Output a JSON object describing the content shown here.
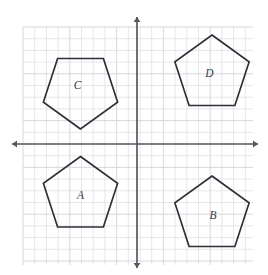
{
  "figure": {
    "kind": "coordinate-plane-with-pentagons",
    "width": 268,
    "height": 275,
    "background_color": "#ffffff"
  },
  "grid": {
    "visible": true,
    "minor_color": "#dcdce2",
    "major_color": "#d2d2da",
    "cell_size_px": 11.7,
    "major_every": 4,
    "x_start": 23,
    "x_end": 253,
    "y_start": 27,
    "y_end": 265
  },
  "axes": {
    "color": "#575760",
    "origin_x": 137,
    "origin_y": 144,
    "x_axis": {
      "label": "",
      "start_x": 12,
      "end_x": 258,
      "arrows": "both"
    },
    "y_axis": {
      "label": "",
      "start_y": 17,
      "end_y": 268,
      "arrows": "both"
    },
    "tick_labels": []
  },
  "chart_data": {
    "type": "scatter",
    "title": "",
    "xlabel": "",
    "ylabel": "",
    "grid": true,
    "legend": "none",
    "shapes": [
      {
        "label": "A",
        "kind": "regular-pentagon",
        "quadrant": "III",
        "orientation": "point-up",
        "center_x": 80.5,
        "center_y": 195.5,
        "radius": 39,
        "rotation_deg": 0,
        "label_x": 80.5,
        "label_y": 196,
        "points": "80.5,156.5 117.6,183.4 103.4,227.0 57.6,227.0 43.4,183.4"
      },
      {
        "label": "B",
        "kind": "regular-pentagon",
        "quadrant": "IV",
        "orientation": "point-up",
        "center_x": 212.0,
        "center_y": 215.0,
        "radius": 39,
        "rotation_deg": 0,
        "label_x": 213.0,
        "label_y": 216,
        "points": "212.0,176.0 249.1,202.9 234.9,246.5 189.1,246.5 174.9,202.9"
      },
      {
        "label": "C",
        "kind": "regular-pentagon",
        "quadrant": "II",
        "orientation": "point-down",
        "center_x": 80.5,
        "center_y": 90.0,
        "radius": 39,
        "rotation_deg": 180,
        "label_x": 77.5,
        "label_y": 86,
        "points": "80.5,129.0 43.4,102.1 57.6,58.5 103.4,58.5 117.6,102.1"
      },
      {
        "label": "D",
        "kind": "regular-pentagon",
        "quadrant": "I",
        "orientation": "point-up",
        "center_x": 212.0,
        "center_y": 74.0,
        "radius": 39,
        "rotation_deg": 0,
        "label_x": 209.5,
        "label_y": 74,
        "points": "212.0,35.0 249.1,61.9 234.9,105.5 189.1,105.5 174.9,61.9"
      }
    ],
    "shape_stroke_color": "#2e2e36",
    "shape_fill": "none",
    "label_color": "#3a3a42"
  }
}
